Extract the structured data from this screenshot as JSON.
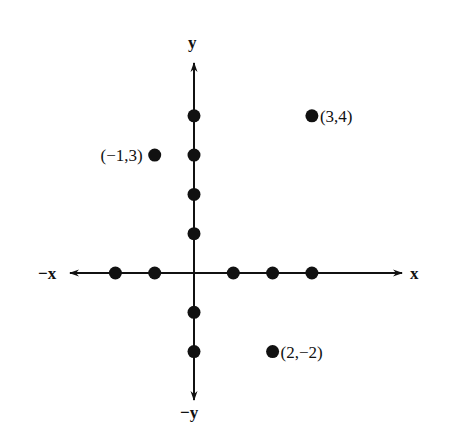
{
  "chart_data": {
    "type": "scatter",
    "title": "",
    "axis_labels": {
      "pos_x": "x",
      "neg_x": "−x",
      "pos_y": "y",
      "neg_y": "−y"
    },
    "axis_points": {
      "x_axis": [
        -2,
        -1,
        1,
        2,
        3
      ],
      "y_axis": [
        4,
        3,
        2,
        1,
        -1,
        -2
      ]
    },
    "labeled_points": [
      {
        "x": 3,
        "y": 4,
        "label": "(3,4)"
      },
      {
        "x": -1,
        "y": 3,
        "label": "(−1,3)"
      },
      {
        "x": 2,
        "y": -2,
        "label": "(2,−2)"
      }
    ],
    "grid": false,
    "xlim": [
      -3,
      5
    ],
    "ylim": [
      -3,
      5
    ]
  },
  "colors": {
    "ink": "#111111",
    "background": "#ffffff"
  }
}
